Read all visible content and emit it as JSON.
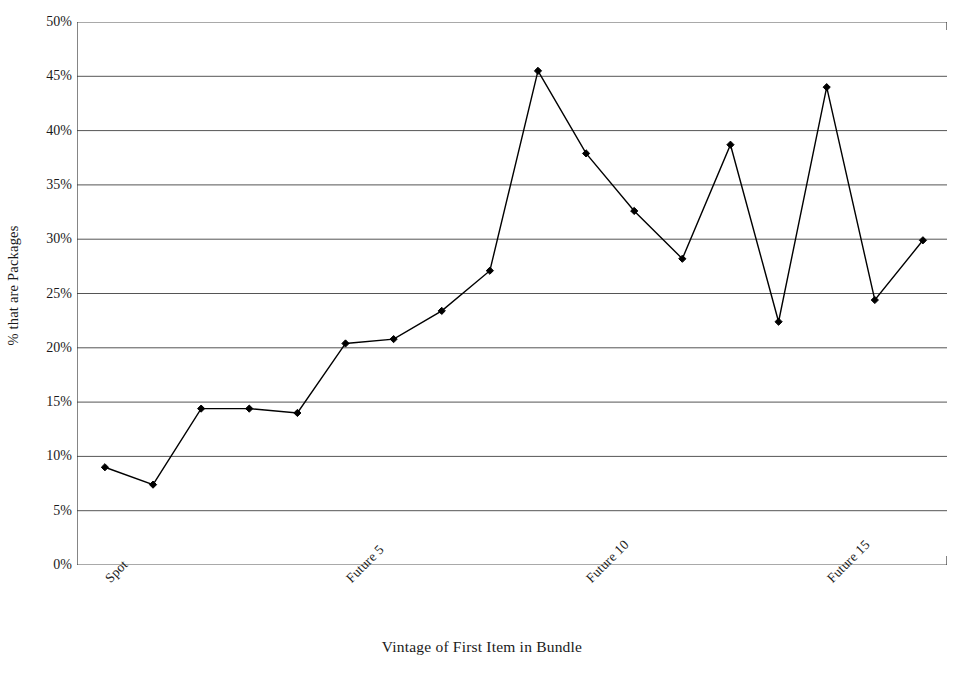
{
  "chart_data": {
    "type": "line",
    "title": "",
    "xlabel": "Vintage of First Item in Bundle",
    "ylabel": "% that are Packages",
    "ylim": [
      0,
      50
    ],
    "y_ticks": [
      0,
      5,
      10,
      15,
      20,
      25,
      30,
      35,
      40,
      45,
      50
    ],
    "y_tick_labels": [
      "0%",
      "5%",
      "10%",
      "15%",
      "20%",
      "25%",
      "30%",
      "35%",
      "40%",
      "45%",
      "50%"
    ],
    "y_tick_suffix": "%",
    "grid": true,
    "grid_axis": "y",
    "legend": false,
    "legend_position": "none",
    "marker": "diamond",
    "line_color": "#000000",
    "marker_color": "#000000",
    "grid_color": "#555555",
    "axis_color": "#333333",
    "background_color": "#ffffff",
    "x_index": [
      0,
      1,
      2,
      3,
      4,
      5,
      6,
      7,
      8,
      9,
      10,
      11,
      12,
      13,
      14,
      15,
      16,
      17
    ],
    "categories": [
      "Spot",
      "",
      "",
      "",
      "",
      "Future 5",
      "",
      "",
      "",
      "",
      "Future 10",
      "",
      "",
      "",
      "",
      "Future 15",
      "",
      ""
    ],
    "x_tick_labels_shown": [
      "Spot",
      "Future 5",
      "Future 10",
      "Future 15"
    ],
    "x_tick_label_indices": [
      0,
      5,
      10,
      15
    ],
    "x_tick_label_rotation": -45,
    "values": [
      9.0,
      7.4,
      14.4,
      14.4,
      14.0,
      20.4,
      20.8,
      23.4,
      27.1,
      45.5,
      37.9,
      32.6,
      28.2,
      38.7,
      22.4,
      44.0,
      24.4,
      29.9
    ],
    "series": [
      {
        "name": "% that are Packages",
        "values": [
          9.0,
          7.4,
          14.4,
          14.4,
          14.0,
          20.4,
          20.8,
          23.4,
          27.1,
          45.5,
          37.9,
          32.6,
          28.2,
          38.7,
          22.4,
          44.0,
          24.4,
          29.9
        ]
      }
    ],
    "n_x_ticks": 18,
    "xlim_index": [
      -0.58,
      17.5
    ]
  }
}
